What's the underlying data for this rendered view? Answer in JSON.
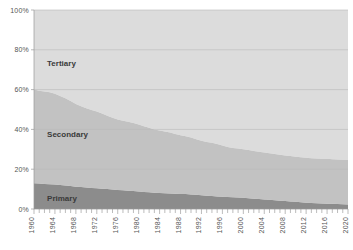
{
  "chart_data": {
    "type": "area",
    "stacked": true,
    "title": "",
    "subtitle": "",
    "xlabel": "",
    "ylabel": "",
    "xlim": [
      1960,
      2020
    ],
    "ylim": [
      0,
      100
    ],
    "grid": true,
    "legend_position": "inline-labels",
    "y_tick_labels": [
      "0%",
      "20%",
      "40%",
      "60%",
      "80%",
      "100%"
    ],
    "y_tick_values": [
      0,
      20,
      40,
      60,
      80,
      100
    ],
    "x_tick_labels": [
      "1960",
      "1964",
      "1968",
      "1972",
      "1976",
      "1980",
      "1984",
      "1988",
      "1992",
      "1996",
      "2000",
      "2004",
      "2008",
      "2012",
      "2016",
      "2020"
    ],
    "x_tick_values": [
      1960,
      1964,
      1968,
      1972,
      1976,
      1980,
      1984,
      1988,
      1992,
      1996,
      2000,
      2004,
      2008,
      2012,
      2016,
      2020
    ],
    "x": [
      1960,
      1961,
      1962,
      1963,
      1964,
      1965,
      1966,
      1967,
      1968,
      1969,
      1970,
      1971,
      1972,
      1973,
      1974,
      1975,
      1976,
      1977,
      1978,
      1979,
      1980,
      1981,
      1982,
      1983,
      1984,
      1985,
      1986,
      1987,
      1988,
      1989,
      1990,
      1991,
      1992,
      1993,
      1994,
      1995,
      1996,
      1997,
      1998,
      1999,
      2000,
      2001,
      2002,
      2003,
      2004,
      2005,
      2006,
      2007,
      2008,
      2009,
      2010,
      2011,
      2012,
      2013,
      2014,
      2015,
      2016,
      2017,
      2018,
      2019,
      2020
    ],
    "series": [
      {
        "name": "Primary",
        "color": "#8c8c8c",
        "label_position": {
          "x": 1962.5,
          "y": 4
        },
        "values": [
          13.0,
          12.8,
          12.6,
          12.5,
          12.3,
          12.0,
          11.8,
          11.5,
          11.2,
          11.0,
          10.8,
          10.6,
          10.4,
          10.2,
          10.0,
          9.8,
          9.6,
          9.4,
          9.2,
          9.0,
          8.8,
          8.6,
          8.4,
          8.2,
          8.0,
          7.9,
          7.8,
          7.7,
          7.6,
          7.5,
          7.3,
          7.1,
          6.9,
          6.7,
          6.5,
          6.3,
          6.1,
          6.0,
          5.9,
          5.8,
          5.6,
          5.4,
          5.2,
          5.0,
          4.8,
          4.6,
          4.4,
          4.2,
          4.0,
          3.8,
          3.6,
          3.4,
          3.2,
          3.0,
          2.9,
          2.8,
          2.7,
          2.6,
          2.5,
          2.4,
          2.3
        ]
      },
      {
        "name": "Secondary",
        "color": "#c2c2c2",
        "label_position": {
          "x": 1962.5,
          "y": 36
        },
        "values": [
          47.0,
          46.6,
          46.4,
          46.2,
          45.6,
          44.8,
          43.8,
          42.8,
          41.6,
          40.6,
          39.8,
          39.2,
          38.6,
          37.8,
          36.8,
          36.0,
          35.4,
          35.0,
          34.6,
          34.2,
          33.6,
          33.0,
          32.4,
          31.8,
          31.4,
          31.0,
          30.6,
          30.0,
          29.4,
          29.0,
          28.6,
          28.0,
          27.4,
          27.0,
          26.8,
          26.4,
          25.8,
          25.2,
          24.8,
          24.6,
          24.4,
          24.2,
          24.0,
          23.8,
          23.6,
          23.4,
          23.2,
          23.0,
          22.9,
          22.8,
          22.7,
          22.6,
          22.5,
          22.5,
          22.5,
          22.5,
          22.5,
          22.4,
          22.4,
          22.4,
          22.4
        ]
      },
      {
        "name": "Tertiary",
        "color": "#dcdcdc",
        "label_position": {
          "x": 1962.5,
          "y": 72
        },
        "values": [
          40.0,
          40.6,
          41.0,
          41.3,
          42.1,
          43.2,
          44.4,
          45.7,
          47.2,
          48.4,
          49.4,
          50.2,
          51.0,
          52.0,
          53.2,
          54.2,
          55.0,
          55.6,
          56.2,
          56.8,
          57.6,
          58.4,
          59.2,
          60.0,
          60.6,
          61.1,
          61.6,
          62.3,
          63.0,
          63.5,
          64.1,
          64.9,
          65.7,
          66.3,
          66.7,
          67.3,
          68.1,
          68.8,
          69.3,
          69.6,
          70.0,
          70.4,
          70.8,
          71.2,
          71.6,
          72.0,
          72.4,
          72.8,
          73.1,
          73.4,
          73.7,
          74.0,
          74.3,
          74.5,
          74.6,
          74.7,
          74.8,
          75.0,
          75.1,
          75.2,
          75.3
        ]
      }
    ]
  }
}
